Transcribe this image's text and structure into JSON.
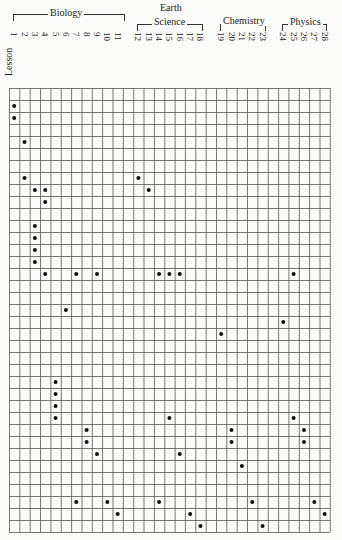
{
  "chart_data": {
    "type": "scatter",
    "title": "",
    "xlabel": "Lesson",
    "ylabel": "",
    "grid": true,
    "grid_columns": 31,
    "grid_rows": 37,
    "groups": [
      {
        "name": "Biology",
        "lessons": [
          1,
          2,
          3,
          4,
          5,
          6,
          7,
          8,
          9,
          10,
          11
        ]
      },
      {
        "name": "Earth Science",
        "lessons": [
          12,
          13,
          14,
          15,
          16,
          17,
          18
        ]
      },
      {
        "name": "Chemistry",
        "lessons": [
          19,
          20,
          21,
          22,
          23
        ]
      },
      {
        "name": "Physics",
        "lessons": [
          24,
          25,
          26,
          27,
          28
        ]
      }
    ],
    "lessons": [
      1,
      2,
      3,
      4,
      5,
      6,
      7,
      8,
      9,
      10,
      11,
      12,
      13,
      14,
      15,
      16,
      17,
      18,
      19,
      20,
      21,
      22,
      23,
      24,
      25,
      26,
      27,
      28
    ],
    "points_lesson_row": [
      [
        1,
        1
      ],
      [
        1,
        2
      ],
      [
        2,
        4
      ],
      [
        2,
        7
      ],
      [
        12,
        7
      ],
      [
        3,
        8
      ],
      [
        4,
        8
      ],
      [
        13,
        8
      ],
      [
        4,
        9
      ],
      [
        3,
        11
      ],
      [
        3,
        12
      ],
      [
        3,
        13
      ],
      [
        3,
        14
      ],
      [
        4,
        15
      ],
      [
        7,
        15
      ],
      [
        9,
        15
      ],
      [
        14,
        15
      ],
      [
        15,
        15
      ],
      [
        16,
        15
      ],
      [
        25,
        15
      ],
      [
        6,
        18
      ],
      [
        24,
        19
      ],
      [
        19,
        20
      ],
      [
        5,
        24
      ],
      [
        5,
        25
      ],
      [
        5,
        26
      ],
      [
        5,
        27
      ],
      [
        15,
        27
      ],
      [
        25,
        27
      ],
      [
        8,
        28
      ],
      [
        20,
        28
      ],
      [
        26,
        28
      ],
      [
        8,
        29
      ],
      [
        20,
        29
      ],
      [
        26,
        29
      ],
      [
        9,
        30
      ],
      [
        16,
        30
      ],
      [
        21,
        31
      ],
      [
        7,
        34
      ],
      [
        10,
        34
      ],
      [
        14,
        34
      ],
      [
        22,
        34
      ],
      [
        27,
        34
      ],
      [
        11,
        35
      ],
      [
        17,
        35
      ],
      [
        28,
        35
      ],
      [
        18,
        36
      ],
      [
        23,
        36
      ]
    ]
  },
  "labels": {
    "lesson": "Lesson",
    "biology": "Biology",
    "earth": "Earth",
    "science": "Science",
    "chemistry": "Chemistry",
    "physics": "Physics"
  }
}
